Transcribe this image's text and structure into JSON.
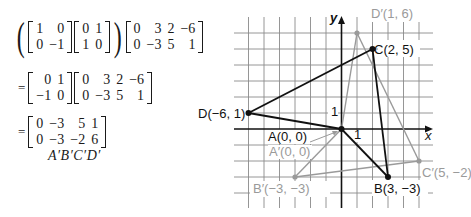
{
  "equations": {
    "line1": {
      "reflection_matrix": [
        [
          "1",
          "0"
        ],
        [
          "0",
          "−1"
        ]
      ],
      "rotation_matrix": [
        [
          "0",
          "1"
        ],
        [
          "1",
          "0"
        ]
      ],
      "vertex_matrix": [
        [
          "0",
          "3",
          "2",
          "−6"
        ],
        [
          "0",
          "−3",
          "5",
          "1"
        ]
      ]
    },
    "line2": {
      "equals": "=",
      "product_matrix": [
        [
          "0",
          "1"
        ],
        [
          "−1",
          "0"
        ]
      ],
      "vertex_matrix": [
        [
          "0",
          "3",
          "2",
          "−6"
        ],
        [
          "0",
          "−3",
          "5",
          "1"
        ]
      ]
    },
    "line3": {
      "equals": "=",
      "result_matrix": [
        [
          "0",
          "−3",
          "5",
          "1"
        ],
        [
          "0",
          "−3",
          "−2",
          "6"
        ]
      ]
    },
    "caption": "A′B′C′D′"
  },
  "graph": {
    "x_axis_label": "x",
    "y_axis_label": "y",
    "x_tick_label": "1",
    "y_tick_label": "1",
    "colors": {
      "original": "#111111",
      "image": "#9a9a9a",
      "grid": "#888888"
    },
    "original_points": {
      "A": {
        "label": "A(0, 0)",
        "x": 0,
        "y": 0
      },
      "B": {
        "label": "B(3, −3)",
        "x": 3,
        "y": -3
      },
      "C": {
        "label": "C(2, 5)",
        "x": 2,
        "y": 5
      },
      "D": {
        "label": "D(−6, 1)",
        "x": -6,
        "y": 1
      }
    },
    "image_points": {
      "A": {
        "label": "A′(0, 0)",
        "x": 0,
        "y": 0
      },
      "B": {
        "label": "B′(−3, −3)",
        "x": -3,
        "y": -3
      },
      "C": {
        "label": "C′(5, −2)",
        "x": 5,
        "y": -2
      },
      "D": {
        "label": "D′(1, 6)",
        "x": 1,
        "y": 6
      }
    }
  }
}
